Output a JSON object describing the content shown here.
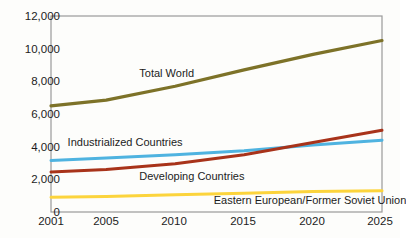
{
  "chart_data": {
    "type": "line",
    "title": "",
    "subtitle": "",
    "xlabel": "",
    "ylabel": "",
    "x": [
      2001,
      2005,
      2010,
      2015,
      2020,
      2025
    ],
    "xlim": [
      2001,
      2025
    ],
    "ylim": [
      0,
      12000
    ],
    "grid": false,
    "legend_position": "inline-annotations",
    "x_tick_labels": [
      "2001",
      "2005",
      "2010",
      "2015",
      "2020",
      "2025"
    ],
    "y_tick_labels": [
      "0",
      "2,000",
      "4,000",
      "6,000",
      "8,000",
      "10,000",
      "12,000"
    ],
    "y_ticks": [
      0,
      2000,
      4000,
      6000,
      8000,
      10000,
      12000
    ],
    "series": [
      {
        "name": "Total World",
        "color": "#7d7228",
        "values": [
          6500,
          6850,
          7700,
          8700,
          9650,
          10500
        ]
      },
      {
        "name": "Industrialized Countries",
        "color": "#4fb3e0",
        "values": [
          3150,
          3300,
          3500,
          3750,
          4100,
          4400
        ]
      },
      {
        "name": "Developing Countries",
        "color": "#a8331a",
        "values": [
          2450,
          2600,
          2950,
          3500,
          4250,
          5000
        ]
      },
      {
        "name": "Eastern European/Former Soviet Union",
        "color": "#fcd43c",
        "values": [
          900,
          950,
          1050,
          1150,
          1250,
          1300
        ]
      }
    ],
    "annotations": [
      {
        "text": "Total World",
        "x": 2007.4,
        "y": 8450
      },
      {
        "text": "Industrialized Countries",
        "x": 2002.2,
        "y": 4250
      },
      {
        "text": "Developing Countries",
        "x": 2007.4,
        "y": 2150
      },
      {
        "text": "Eastern European/Former Soviet Union",
        "x": 2012.8,
        "y": 700
      }
    ]
  },
  "axis": {
    "y_labels": [
      "12,000",
      "10,000",
      "8,000",
      "6,000",
      "4,000",
      "2,000",
      "0"
    ],
    "x_labels": [
      "2001",
      "2005",
      "2010",
      "2015",
      "2020",
      "2025"
    ]
  },
  "labels": {
    "total_world": "Total World",
    "industrialized": "Industrialized Countries",
    "developing": "Developing Countries",
    "eastern_european": "Eastern European/Former Soviet Union"
  },
  "colors": {
    "total_world": "#7d7228",
    "industrialized": "#4fb3e0",
    "developing": "#a8331a",
    "eastern_european": "#fcd43c",
    "plot_border": "#9a9a9a",
    "text": "#1c1c1c",
    "background": "#fdfdfb"
  }
}
